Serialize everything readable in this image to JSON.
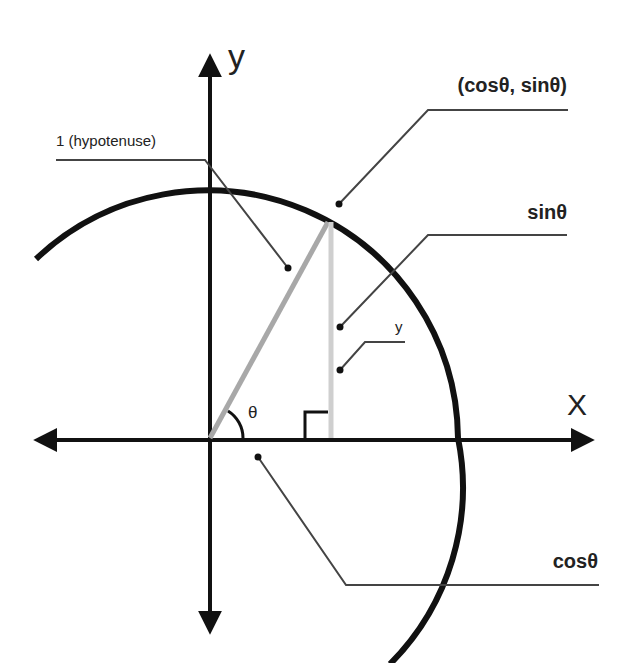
{
  "axes": {
    "x_label": "X",
    "y_label": "y"
  },
  "angle_label": "θ",
  "callouts": {
    "point": "(cosθ, sinθ)",
    "hypotenuse": "1 (hypotenuse)",
    "sin": "sinθ",
    "y": "y",
    "cos": "cosθ"
  },
  "colors": {
    "axis": "#111111",
    "circle": "#111111",
    "hypotenuse": "#a8a8a8",
    "opposite_side": "#cfcfcf",
    "leader": "#444444",
    "text": "#222222"
  }
}
